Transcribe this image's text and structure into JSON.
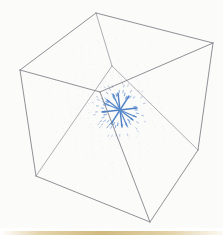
{
  "figure": {
    "background_color": "#fbfbfa",
    "width": 223,
    "height": 237
  },
  "cube": {
    "label": "wireframe bounding box",
    "edge_color": "#83838b",
    "back_edge_color": "#9a9aa2",
    "edge_width": 0.9,
    "vertices": {
      "top_back": [
        96,
        13
      ],
      "top_left": [
        20,
        70
      ],
      "top_right": [
        213,
        43
      ],
      "top_front": [
        100,
        92
      ],
      "bottom_left": [
        36,
        176
      ],
      "bottom_front": [
        150,
        222
      ],
      "bottom_right": [
        198,
        150
      ],
      "bottom_back": [
        112,
        66
      ]
    },
    "edges": [
      [
        "top_back",
        "top_left"
      ],
      [
        "top_back",
        "top_right"
      ],
      [
        "top_left",
        "top_front"
      ],
      [
        "top_right",
        "top_front"
      ],
      [
        "top_left",
        "bottom_left"
      ],
      [
        "top_right",
        "bottom_right"
      ],
      [
        "top_front",
        "bottom_front"
      ],
      [
        "bottom_left",
        "bottom_front"
      ],
      [
        "bottom_front",
        "bottom_right"
      ]
    ],
    "hidden_edges": [
      [
        "top_back",
        "bottom_back"
      ],
      [
        "bottom_back",
        "bottom_left"
      ],
      [
        "bottom_back",
        "bottom_right"
      ]
    ]
  },
  "chart_data": {
    "type": "scatter",
    "plot_kind": "3d-quiver-vector-field",
    "xlabel": "",
    "ylabel": "",
    "zlabel": "",
    "grid": false,
    "legend": null,
    "arrow_color": "#4a72ad",
    "arrow_color_bright": "#5b8fd4",
    "arrow_color_faint": "#b9c4d8",
    "source_center_px": [
      120,
      110
    ],
    "field_description": "radially divergent (source/monopole) field; arrow length decays with distance from center",
    "grid_counts": {
      "nx": 9,
      "ny": 9,
      "nz": 9
    },
    "arrows": [
      {
        "x": 120,
        "y": 110,
        "dx": 17,
        "dy": -2,
        "w": 1.5,
        "c": "#4f7fc4"
      },
      {
        "x": 120,
        "y": 110,
        "dx": -18,
        "dy": 2,
        "w": 1.5,
        "c": "#4f7fc4"
      },
      {
        "x": 120,
        "y": 110,
        "dx": 9,
        "dy": -14,
        "w": 1.4,
        "c": "#5385c9"
      },
      {
        "x": 120,
        "y": 110,
        "dx": -9,
        "dy": 14,
        "w": 1.4,
        "c": "#5385c9"
      },
      {
        "x": 120,
        "y": 110,
        "dx": 13,
        "dy": 10,
        "w": 1.3,
        "c": "#5385c9"
      },
      {
        "x": 120,
        "y": 110,
        "dx": -13,
        "dy": -10,
        "w": 1.3,
        "c": "#5385c9"
      },
      {
        "x": 120,
        "y": 110,
        "dx": 2,
        "dy": 17,
        "w": 1.4,
        "c": "#4f7fc4"
      },
      {
        "x": 120,
        "y": 110,
        "dx": -2,
        "dy": -17,
        "w": 1.4,
        "c": "#4f7fc4"
      },
      {
        "x": 120,
        "y": 110,
        "dx": 16,
        "dy": 7,
        "w": 1.2,
        "c": "#5a8ccd"
      },
      {
        "x": 120,
        "y": 110,
        "dx": -16,
        "dy": -7,
        "w": 1.2,
        "c": "#5a8ccd"
      },
      {
        "x": 120,
        "y": 110,
        "dx": 7,
        "dy": 16,
        "w": 1.2,
        "c": "#5a8ccd"
      },
      {
        "x": 120,
        "y": 110,
        "dx": -7,
        "dy": -16,
        "w": 1.2,
        "c": "#5a8ccd"
      }
    ]
  },
  "decoration": {
    "bottom_band_label": "paper edge shadow band",
    "bottom_band_color": "#c6a65c",
    "bottom_band_y": 231,
    "bottom_band_height": 4
  }
}
